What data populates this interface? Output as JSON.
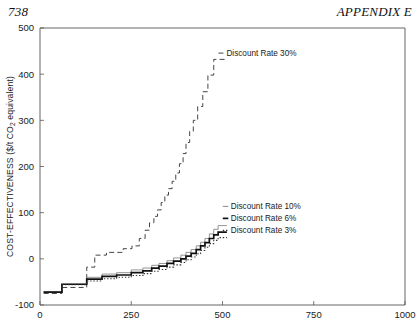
{
  "page": {
    "number": "738",
    "running_head": "APPENDIX E"
  },
  "chart_data": {
    "type": "line",
    "title": "",
    "xlabel": "",
    "ylabel": "COST-EFFECTIVENESS ($/t CO2 equivalent)",
    "ylabel_parts": {
      "pre": "COST-EFFECTIVENESS ($/t CO",
      "sub": "2",
      "post": " equivalent)"
    },
    "xlim": [
      0,
      1000
    ],
    "ylim": [
      -100,
      500
    ],
    "xticks": [
      0,
      250,
      500,
      750,
      1000
    ],
    "yticks": [
      -100,
      0,
      100,
      200,
      300,
      400,
      500
    ],
    "xtick_labels": [
      "0",
      "250",
      "500",
      "750",
      "1000"
    ],
    "ytick_labels": [
      "-100",
      "0",
      "100",
      "200",
      "300",
      "400",
      "500"
    ],
    "grid": false,
    "legend_position": "inline-annotations",
    "step_shape": "hv",
    "series": [
      {
        "name": "Discount Rate 30%",
        "label": "Discount Rate 30%",
        "style": "dashed",
        "color": "#444444",
        "width": 1.0,
        "label_xy": [
          508,
          440
        ],
        "points": [
          [
            10,
            -75
          ],
          [
            60,
            -75
          ],
          [
            60,
            -62
          ],
          [
            128,
            -62
          ],
          [
            128,
            -18
          ],
          [
            150,
            -18
          ],
          [
            150,
            8
          ],
          [
            182,
            8
          ],
          [
            182,
            14
          ],
          [
            228,
            14
          ],
          [
            228,
            22
          ],
          [
            252,
            22
          ],
          [
            252,
            28
          ],
          [
            272,
            28
          ],
          [
            272,
            44
          ],
          [
            288,
            44
          ],
          [
            288,
            62
          ],
          [
            300,
            62
          ],
          [
            300,
            78
          ],
          [
            312,
            78
          ],
          [
            312,
            92
          ],
          [
            322,
            92
          ],
          [
            322,
            106
          ],
          [
            332,
            106
          ],
          [
            332,
            122
          ],
          [
            342,
            122
          ],
          [
            342,
            138
          ],
          [
            352,
            138
          ],
          [
            352,
            152
          ],
          [
            362,
            152
          ],
          [
            362,
            168
          ],
          [
            372,
            168
          ],
          [
            372,
            186
          ],
          [
            382,
            186
          ],
          [
            382,
            206
          ],
          [
            392,
            206
          ],
          [
            392,
            228
          ],
          [
            400,
            228
          ],
          [
            400,
            252
          ],
          [
            410,
            252
          ],
          [
            410,
            276
          ],
          [
            420,
            276
          ],
          [
            420,
            300
          ],
          [
            432,
            300
          ],
          [
            432,
            330
          ],
          [
            446,
            330
          ],
          [
            446,
            362
          ],
          [
            460,
            362
          ],
          [
            460,
            398
          ],
          [
            476,
            398
          ],
          [
            476,
            432
          ],
          [
            508,
            432
          ]
        ]
      },
      {
        "name": "Discount Rate 10%",
        "label": "Discount Rate 10%",
        "style": "solid-thin",
        "color": "#888888",
        "width": 0.9,
        "label_xy": [
          520,
          108
        ],
        "points": [
          [
            10,
            -72
          ],
          [
            60,
            -72
          ],
          [
            60,
            -55
          ],
          [
            128,
            -55
          ],
          [
            128,
            -40
          ],
          [
            170,
            -40
          ],
          [
            170,
            -33
          ],
          [
            210,
            -33
          ],
          [
            210,
            -30
          ],
          [
            250,
            -30
          ],
          [
            250,
            -24
          ],
          [
            282,
            -24
          ],
          [
            282,
            -20
          ],
          [
            306,
            -20
          ],
          [
            306,
            -14
          ],
          [
            326,
            -14
          ],
          [
            326,
            -10
          ],
          [
            348,
            -10
          ],
          [
            348,
            -4
          ],
          [
            366,
            -4
          ],
          [
            366,
            2
          ],
          [
            386,
            2
          ],
          [
            386,
            8
          ],
          [
            400,
            8
          ],
          [
            400,
            14
          ],
          [
            414,
            14
          ],
          [
            414,
            20
          ],
          [
            428,
            20
          ],
          [
            428,
            28
          ],
          [
            440,
            28
          ],
          [
            440,
            36
          ],
          [
            452,
            36
          ],
          [
            452,
            44
          ],
          [
            464,
            44
          ],
          [
            464,
            54
          ],
          [
            476,
            54
          ],
          [
            476,
            64
          ],
          [
            488,
            64
          ],
          [
            488,
            72
          ],
          [
            512,
            72
          ]
        ]
      },
      {
        "name": "Discount Rate 6%",
        "label": "Discount Rate 6%",
        "style": "solid-thick",
        "color": "#111111",
        "width": 1.7,
        "label_xy": [
          520,
          82
        ],
        "points": [
          [
            10,
            -72
          ],
          [
            60,
            -72
          ],
          [
            60,
            -55
          ],
          [
            128,
            -55
          ],
          [
            128,
            -44
          ],
          [
            170,
            -44
          ],
          [
            170,
            -38
          ],
          [
            210,
            -38
          ],
          [
            210,
            -35
          ],
          [
            250,
            -35
          ],
          [
            250,
            -30
          ],
          [
            282,
            -30
          ],
          [
            282,
            -26
          ],
          [
            306,
            -26
          ],
          [
            306,
            -20
          ],
          [
            326,
            -20
          ],
          [
            326,
            -16
          ],
          [
            348,
            -16
          ],
          [
            348,
            -10
          ],
          [
            366,
            -10
          ],
          [
            366,
            -5
          ],
          [
            386,
            -5
          ],
          [
            386,
            0
          ],
          [
            400,
            0
          ],
          [
            400,
            6
          ],
          [
            414,
            6
          ],
          [
            414,
            12
          ],
          [
            428,
            12
          ],
          [
            428,
            20
          ],
          [
            440,
            20
          ],
          [
            440,
            28
          ],
          [
            452,
            28
          ],
          [
            452,
            35
          ],
          [
            464,
            35
          ],
          [
            464,
            44
          ],
          [
            476,
            44
          ],
          [
            476,
            52
          ],
          [
            488,
            52
          ],
          [
            488,
            58
          ],
          [
            512,
            58
          ]
        ]
      },
      {
        "name": "Discount Rate 3%",
        "label": "Discount Rate 3%",
        "style": "dotted",
        "color": "#333333",
        "width": 1.1,
        "label_xy": [
          520,
          56
        ],
        "points": [
          [
            10,
            -72
          ],
          [
            60,
            -72
          ],
          [
            60,
            -56
          ],
          [
            128,
            -56
          ],
          [
            128,
            -48
          ],
          [
            170,
            -48
          ],
          [
            170,
            -43
          ],
          [
            210,
            -43
          ],
          [
            210,
            -40
          ],
          [
            250,
            -40
          ],
          [
            250,
            -36
          ],
          [
            282,
            -36
          ],
          [
            282,
            -32
          ],
          [
            306,
            -32
          ],
          [
            306,
            -27
          ],
          [
            326,
            -27
          ],
          [
            326,
            -23
          ],
          [
            348,
            -23
          ],
          [
            348,
            -18
          ],
          [
            366,
            -18
          ],
          [
            366,
            -13
          ],
          [
            386,
            -13
          ],
          [
            386,
            -8
          ],
          [
            400,
            -8
          ],
          [
            400,
            -2
          ],
          [
            414,
            -2
          ],
          [
            414,
            4
          ],
          [
            428,
            4
          ],
          [
            428,
            11
          ],
          [
            440,
            11
          ],
          [
            440,
            18
          ],
          [
            452,
            18
          ],
          [
            452,
            25
          ],
          [
            464,
            25
          ],
          [
            464,
            33
          ],
          [
            476,
            33
          ],
          [
            476,
            40
          ],
          [
            488,
            40
          ],
          [
            488,
            46
          ],
          [
            512,
            46
          ]
        ]
      }
    ]
  }
}
